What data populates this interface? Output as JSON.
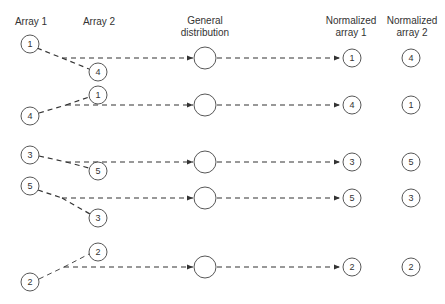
{
  "headers": {
    "array1": "Array 1",
    "array2": "Array 2",
    "general_line1": "General",
    "general_line2": "distribution",
    "norm1_line1": "Normalized",
    "norm1_line2": "array 1",
    "norm2_line1": "Normalized",
    "norm2_line2": "array 2"
  },
  "rows": [
    {
      "array1": "1",
      "array2": "4",
      "norm1": "1",
      "norm2": "4"
    },
    {
      "array1": "4",
      "array2": "1",
      "norm1": "4",
      "norm2": "1"
    },
    {
      "array1": "3",
      "array2": "5",
      "norm1": "3",
      "norm2": "5"
    },
    {
      "array1": "5",
      "array2": "3",
      "norm1": "5",
      "norm2": "3"
    },
    {
      "array1": "2",
      "array2": "2",
      "norm1": "2",
      "norm2": "2"
    }
  ],
  "colors": {
    "stroke": "#333333",
    "background": "#ffffff"
  }
}
